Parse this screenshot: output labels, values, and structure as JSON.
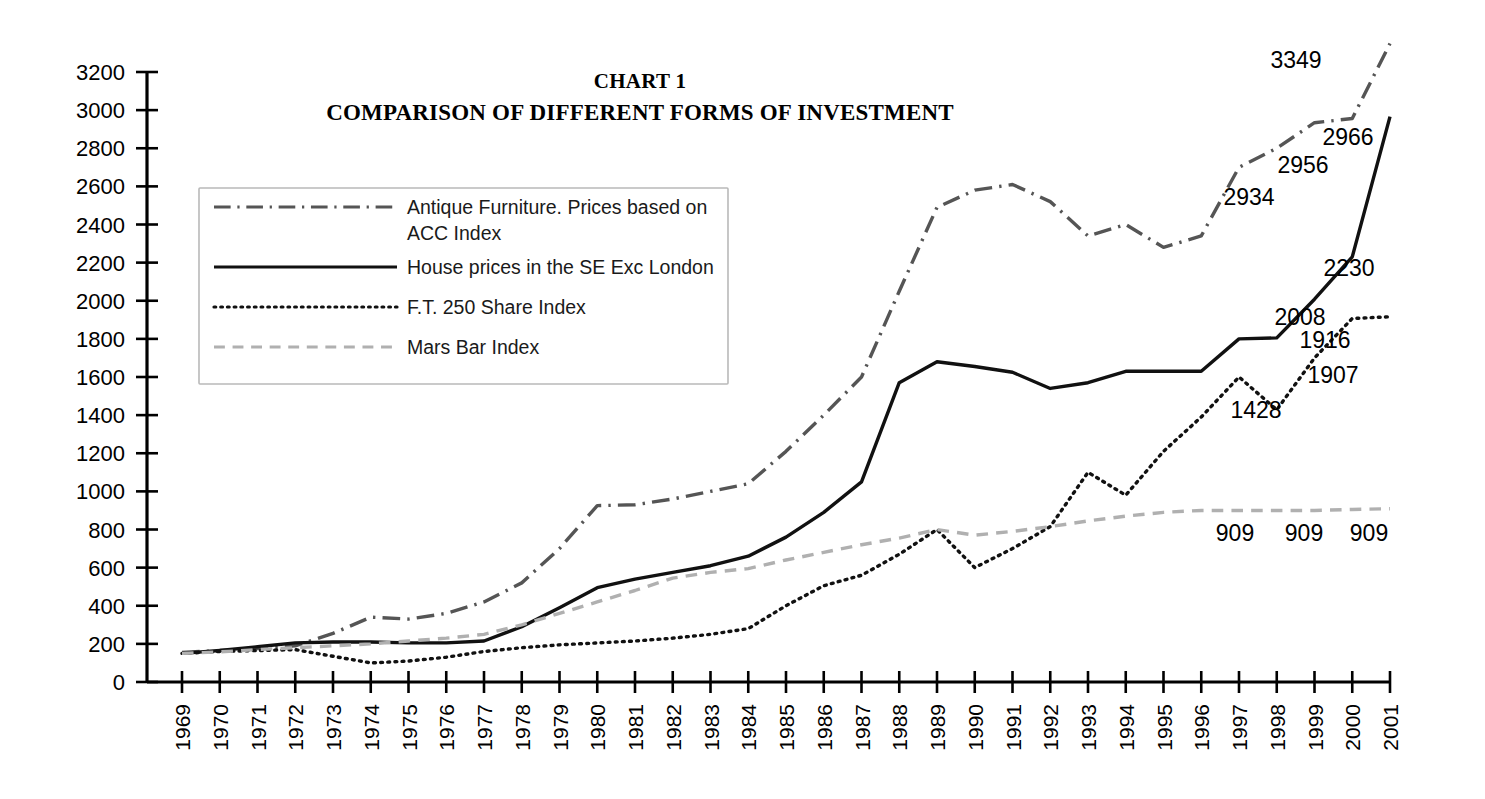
{
  "title": {
    "line1": "CHART 1",
    "line2": "COMPARISON OF DIFFERENT FORMS OF INVESTMENT"
  },
  "legend": {
    "items": [
      {
        "label": "Antique Furniture. Prices based on ACC Index",
        "label_l1": "Antique Furniture. Prices based on",
        "label_l2": "ACC Index",
        "style": "dashdot",
        "color": "#555555"
      },
      {
        "label": "House prices in the SE Exc London",
        "label_l1": "House prices in the SE Exc London",
        "label_l2": "",
        "style": "solid",
        "color": "#111111"
      },
      {
        "label": "F.T. 250 Share Index",
        "label_l1": "F.T. 250 Share Index",
        "label_l2": "",
        "style": "dotted",
        "color": "#111111"
      },
      {
        "label": "Mars Bar Index",
        "label_l1": "Mars Bar Index",
        "label_l2": "",
        "style": "dashed",
        "color": "#b0b0b0"
      }
    ]
  },
  "annotations": [
    {
      "text": "3349",
      "x": 1296,
      "y": 68
    },
    {
      "text": "2966",
      "x": 1348,
      "y": 145
    },
    {
      "text": "2956",
      "x": 1303,
      "y": 173
    },
    {
      "text": "2934",
      "x": 1249,
      "y": 205
    },
    {
      "text": "2230",
      "x": 1349,
      "y": 276
    },
    {
      "text": "2008",
      "x": 1300,
      "y": 325
    },
    {
      "text": "1916",
      "x": 1325,
      "y": 348
    },
    {
      "text": "1907",
      "x": 1333,
      "y": 383
    },
    {
      "text": "1428",
      "x": 1256,
      "y": 418
    },
    {
      "text": "909",
      "x": 1235,
      "y": 541
    },
    {
      "text": "909",
      "x": 1304,
      "y": 541
    },
    {
      "text": "909",
      "x": 1369,
      "y": 541
    }
  ],
  "chart_data": {
    "type": "line",
    "xlabel": "",
    "ylabel": "",
    "xlim": [
      1969,
      2001
    ],
    "ylim": [
      0,
      3200
    ],
    "ytick_step": 200,
    "grid": false,
    "legend_position": "upper-left-inside",
    "yticks": [
      0,
      200,
      400,
      600,
      800,
      1000,
      1200,
      1400,
      1600,
      1800,
      2000,
      2200,
      2400,
      2600,
      2800,
      3000,
      3200
    ],
    "categories": [
      1969,
      1970,
      1971,
      1972,
      1973,
      1974,
      1975,
      1976,
      1977,
      1978,
      1979,
      1980,
      1981,
      1982,
      1983,
      1984,
      1985,
      1986,
      1987,
      1988,
      1989,
      1990,
      1991,
      1992,
      1993,
      1994,
      1995,
      1996,
      1997,
      1998,
      1999,
      2000,
      2001
    ],
    "series": [
      {
        "name": "Antique Furniture. Prices based on ACC Index",
        "style": "dashdot",
        "color": "#555555",
        "width": 3.4,
        "values": [
          155,
          165,
          175,
          190,
          255,
          340,
          330,
          360,
          420,
          520,
          700,
          925,
          930,
          960,
          1000,
          1040,
          1210,
          1400,
          1600,
          2050,
          2490,
          2580,
          2610,
          2520,
          2340,
          2400,
          2280,
          2340,
          2700,
          2800,
          2934,
          2956,
          3349
        ]
      },
      {
        "name": "House prices in the SE Exc London",
        "style": "solid",
        "color": "#111111",
        "width": 3.4,
        "values": [
          150,
          165,
          185,
          205,
          210,
          210,
          205,
          205,
          215,
          290,
          390,
          495,
          540,
          575,
          610,
          660,
          760,
          890,
          1050,
          1570,
          1680,
          1655,
          1625,
          1540,
          1570,
          1630,
          1630,
          1630,
          1800,
          1805,
          2008,
          2230,
          2966
        ]
      },
      {
        "name": "F.T. 250 Share Index",
        "style": "dotted",
        "color": "#111111",
        "width": 3.4,
        "values": [
          150,
          160,
          165,
          170,
          135,
          100,
          110,
          130,
          160,
          180,
          195,
          205,
          215,
          230,
          250,
          280,
          400,
          505,
          560,
          670,
          800,
          600,
          700,
          815,
          1100,
          980,
          1210,
          1390,
          1600,
          1428,
          1700,
          1907,
          1916
        ]
      },
      {
        "name": "Mars Bar Index",
        "style": "dashed",
        "color": "#b0b0b0",
        "width": 3.4,
        "values": [
          150,
          158,
          170,
          180,
          190,
          200,
          215,
          230,
          250,
          300,
          360,
          420,
          480,
          545,
          575,
          595,
          640,
          680,
          720,
          755,
          800,
          770,
          790,
          815,
          845,
          870,
          890,
          900,
          900,
          900,
          900,
          905,
          909
        ]
      }
    ]
  },
  "geometry": {
    "plot_left": 182,
    "plot_right": 1390,
    "plot_top": 72,
    "plot_bottom": 682,
    "axis_x": 147,
    "tick_len": 11
  }
}
